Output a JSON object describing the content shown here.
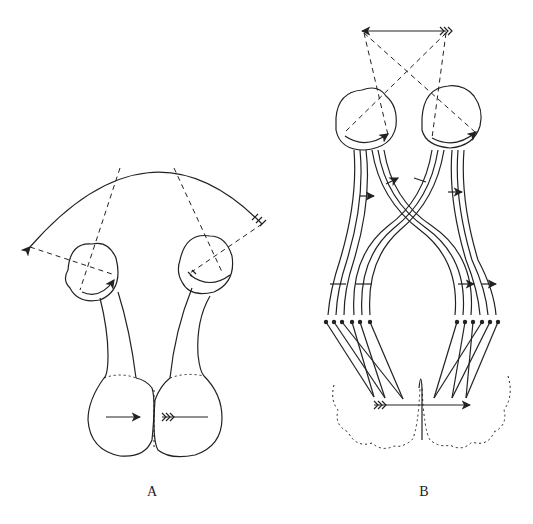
{
  "figure": {
    "panel_a": {
      "label": "A"
    },
    "panel_b": {
      "label": "B"
    }
  }
}
